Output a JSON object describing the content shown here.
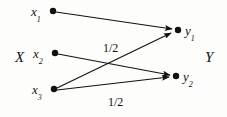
{
  "diagram": {
    "background_color": "#fdfdfc",
    "ink_color": "#111111",
    "sets": [
      {
        "id": "X",
        "label": "X",
        "x": 15,
        "y": 50
      },
      {
        "id": "Y",
        "label": "Y",
        "x": 205,
        "y": 50
      }
    ],
    "nodes": [
      {
        "id": "x1",
        "label": "x",
        "sub": "1",
        "cx": 53,
        "cy": 11,
        "label_x": 31,
        "label_y": 5
      },
      {
        "id": "x2",
        "label": "x",
        "sub": "2",
        "cx": 55,
        "cy": 53,
        "label_x": 33,
        "label_y": 47
      },
      {
        "id": "x3",
        "label": "x",
        "sub": "3",
        "cx": 54,
        "cy": 89,
        "label_x": 32,
        "label_y": 83
      },
      {
        "id": "y1",
        "label": "y",
        "sub": "1",
        "cx": 178,
        "cy": 30,
        "label_x": 185,
        "label_y": 24
      },
      {
        "id": "y2",
        "label": "y",
        "sub": "2",
        "cx": 176,
        "cy": 76,
        "label_x": 183,
        "label_y": 70
      }
    ],
    "node_radius": 3.2,
    "edges": [
      {
        "id": "e1",
        "from": "x1",
        "to": "y1",
        "x1": 56,
        "y1": 12,
        "x2": 172,
        "y2": 29,
        "label": ""
      },
      {
        "id": "e2",
        "from": "x2",
        "to": "y2",
        "x1": 58,
        "y1": 54,
        "x2": 170,
        "y2": 75,
        "label": ""
      },
      {
        "id": "e3",
        "from": "x3",
        "to": "y1",
        "x1": 57,
        "y1": 88,
        "x2": 171,
        "y2": 33,
        "label": "1/2"
      },
      {
        "id": "e4",
        "from": "x3",
        "to": "y2",
        "x1": 57,
        "y1": 90,
        "x2": 169,
        "y2": 77,
        "label": "1/2"
      }
    ],
    "edge_labels": [
      {
        "id": "label-upper",
        "text": "1/2",
        "x": 103,
        "y": 42,
        "for_edge": "e3"
      },
      {
        "id": "label-lower",
        "text": "1/2",
        "x": 108,
        "y": 96,
        "for_edge": "e4"
      }
    ],
    "stroke_width": 1.1,
    "arrow_size": 7
  }
}
